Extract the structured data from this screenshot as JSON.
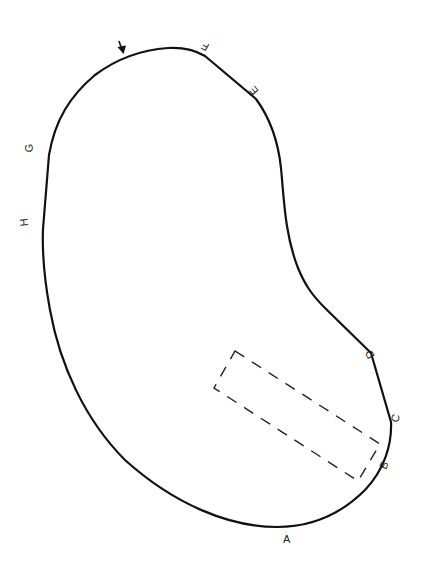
{
  "diagram": {
    "colors": {
      "outline": "#111111",
      "dashed_rect": "#222222",
      "labels": "#222222",
      "background": "#ffffff"
    },
    "labels": {
      "A": "A",
      "B": "B",
      "C": "C",
      "D": "D",
      "E": "E",
      "F": "F",
      "G": "G",
      "H": "H"
    },
    "points": [
      {
        "id": "A",
        "label": "A"
      },
      {
        "id": "B",
        "label": "B"
      },
      {
        "id": "C",
        "label": "C"
      },
      {
        "id": "D",
        "label": "D"
      },
      {
        "id": "E",
        "label": "E"
      },
      {
        "id": "F",
        "label": "F"
      },
      {
        "id": "G",
        "label": "G"
      },
      {
        "id": "H",
        "label": "H"
      }
    ],
    "markers": {
      "arrow": "down-arrow-icon"
    },
    "regions": {
      "dashed_rectangle": "dashed-rectangle"
    }
  }
}
